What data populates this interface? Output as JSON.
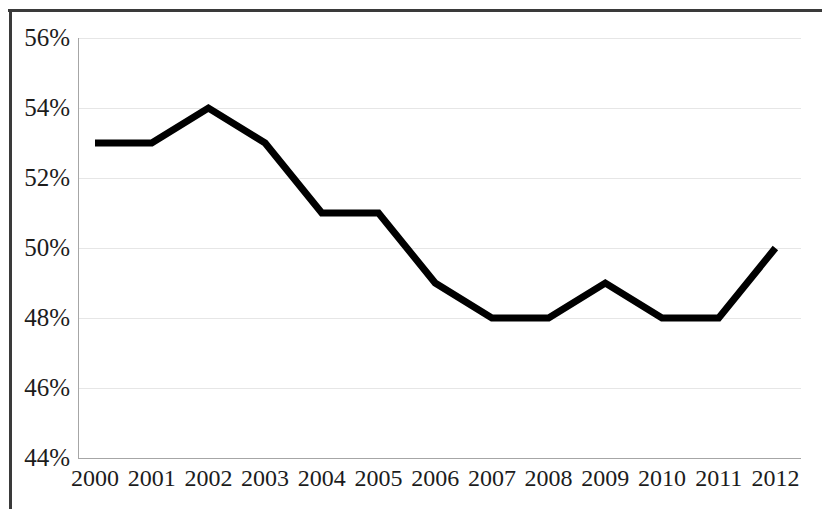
{
  "chart_data": {
    "type": "line",
    "title": "",
    "subtitle": "",
    "xlabel": "",
    "ylabel": "",
    "categories": [
      "2000",
      "2001",
      "2002",
      "2003",
      "2004",
      "2005",
      "2006",
      "2007",
      "2008",
      "2009",
      "2010",
      "2011",
      "2012"
    ],
    "x": [
      2000,
      2001,
      2002,
      2003,
      2004,
      2005,
      2006,
      2007,
      2008,
      2009,
      2010,
      2011,
      2012
    ],
    "values": [
      53,
      53,
      54,
      53,
      51,
      51,
      49,
      48,
      48,
      49,
      48,
      48,
      50
    ],
    "value_labels": [
      "53%",
      "53%",
      "54%",
      "53%",
      "51%",
      "51%",
      "49%",
      "48%",
      "48%",
      "49%",
      "48%",
      "48%",
      "50%"
    ],
    "series": [
      {
        "name": "",
        "values": [
          53,
          53,
          54,
          53,
          51,
          51,
          49,
          48,
          48,
          49,
          48,
          48,
          50
        ],
        "color": "#000000"
      }
    ],
    "ylim": [
      44,
      56
    ],
    "xlim": [
      2000,
      2012
    ],
    "ytick_labels": [
      "56%",
      "54%",
      "52%",
      "50%",
      "48%",
      "46%",
      "44%"
    ],
    "ytick_values": [
      56,
      54,
      52,
      50,
      48,
      46,
      44
    ],
    "xtick_labels": [
      "2000",
      "2001",
      "2002",
      "2003",
      "2004",
      "2005",
      "2006",
      "2007",
      "2008",
      "2009",
      "2010",
      "2011",
      "2012"
    ],
    "grid": "horizontal",
    "legend": "none",
    "annotations": [],
    "colors": {
      "line": "#000000",
      "gridline": "#e6e6e6",
      "axis": "#a6a6a6",
      "frame": "#3a3a3a",
      "text": "#1c1c1c",
      "background": "#ffffff"
    }
  }
}
